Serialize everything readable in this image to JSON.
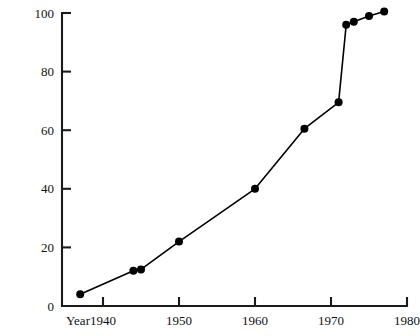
{
  "chart_data": {
    "type": "line",
    "title": "",
    "xlabel": "Year",
    "ylabel": "",
    "xlim": [
      1935,
      1980
    ],
    "ylim": [
      0,
      100
    ],
    "grid": false,
    "legend": null,
    "x_ticks": [
      1940,
      1950,
      1960,
      1970,
      1980
    ],
    "x_tick_labels": [
      "1940",
      "1950",
      "1960",
      "1970",
      "1980"
    ],
    "y_ticks": [
      0,
      20,
      40,
      60,
      80,
      100
    ],
    "y_tick_labels": [
      "0",
      "20",
      "40",
      "60",
      "80",
      "100"
    ],
    "markers": "filled-circle",
    "series": [
      {
        "name": "series-1",
        "x": [
          1937,
          1944,
          1945,
          1950,
          1960,
          1966.5,
          1971,
          1972,
          1973,
          1975,
          1977
        ],
        "values": [
          4,
          12,
          12.5,
          22,
          40,
          60.5,
          69.5,
          96,
          97,
          99,
          100.5
        ]
      }
    ]
  },
  "axes": {
    "x_axis_label": "Year",
    "y_axis_label": ""
  },
  "colors": {
    "line": "#000000",
    "marker": "#000000",
    "axis": "#1a1a1a",
    "background": "#ffffff"
  }
}
